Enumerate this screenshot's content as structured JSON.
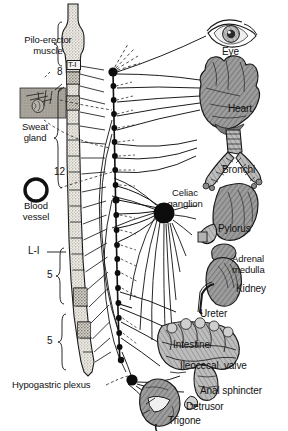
{
  "figure": {
    "colors": {
      "ink": "#111111",
      "organ_fill": "#9a9a9a",
      "organ_fill_light": "#b8b8b8",
      "cord_fill": "#d8d4cc",
      "ganglion": "#0d0d0d",
      "background": "#ffffff"
    }
  },
  "spinal_cord": {
    "segment_marks": [
      {
        "label": "8",
        "name": "cervical-count"
      },
      {
        "label": "T-I",
        "name": "thoracic-one"
      },
      {
        "label": "12",
        "name": "thoracic-count"
      },
      {
        "label": "L-I",
        "name": "lumbar-one"
      },
      {
        "label": "5",
        "name": "lumbar-count"
      },
      {
        "label": "5",
        "name": "sacral-count"
      }
    ]
  },
  "left_insets": [
    {
      "label": "Pilo-erector\nmuscle",
      "name": "piloerector-muscle"
    },
    {
      "label": "Sweat\ngland",
      "name": "sweat-gland"
    },
    {
      "label": "Blood\nvessel",
      "name": "blood-vessel"
    }
  ],
  "ganglia": [
    {
      "label": "Celiac\nganglion",
      "name": "celiac-ganglion"
    },
    {
      "label": "Hypogastric plexus",
      "name": "hypogastric-plexus"
    }
  ],
  "organs": [
    {
      "label": "Eye",
      "name": "eye"
    },
    {
      "label": "Heart",
      "name": "heart"
    },
    {
      "label": "Bronchi",
      "name": "bronchi"
    },
    {
      "label": "Pylorus",
      "name": "pylorus"
    },
    {
      "label": "Adrenal\nmedulla",
      "name": "adrenal-medulla"
    },
    {
      "label": "Kidney",
      "name": "kidney"
    },
    {
      "label": "Ureter",
      "name": "ureter"
    },
    {
      "label": "Intestine",
      "name": "intestine"
    },
    {
      "label": "Ileocecal  valve",
      "name": "ileocecal-valve"
    },
    {
      "label": "Anal sphincter",
      "name": "anal-sphincter"
    },
    {
      "label": "Detrusor",
      "name": "detrusor"
    },
    {
      "label": "Trigone",
      "name": "trigone"
    }
  ]
}
